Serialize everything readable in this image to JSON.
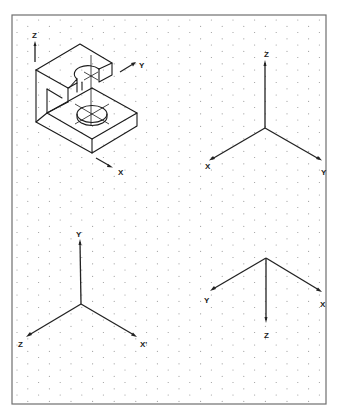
{
  "sheet": {
    "type": "isometric dot grid worksheet",
    "frame": {
      "x": 12,
      "y": 15,
      "width": 314,
      "height": 389,
      "stroke": "#6f6f6f"
    },
    "grid": {
      "dot_color": "#9a9a9a",
      "dx": 21.6,
      "dy": 6.25
    }
  },
  "figures": [
    {
      "id": "object-view",
      "description": "Isometric pictorial of C-shaped bracket with holes",
      "labels": {
        "z": "Z",
        "y": "Y",
        "x": "X"
      }
    },
    {
      "id": "axes-standard",
      "labels": {
        "z": "Z",
        "x": "X",
        "y": "Y"
      },
      "origin": [
        265,
        128
      ],
      "ends": {
        "z": [
          265,
          61
        ],
        "x": [
          210,
          160
        ],
        "y": [
          321,
          160
        ]
      }
    },
    {
      "id": "axes-rotated-y-up",
      "labels": {
        "y": "Y",
        "z": "Z",
        "x": "X'"
      },
      "origin": [
        81,
        304
      ],
      "ends": {
        "y": [
          80,
          240
        ],
        "z": [
          27,
          336
        ],
        "x": [
          136,
          336
        ]
      }
    },
    {
      "id": "axes-z-down",
      "labels": {
        "y": "Y",
        "x": "X",
        "z": "Z"
      },
      "origin": [
        266,
        258
      ],
      "ends": {
        "y": [
          211,
          290
        ],
        "x": [
          321,
          291
        ],
        "z": [
          266,
          322
        ]
      }
    }
  ]
}
